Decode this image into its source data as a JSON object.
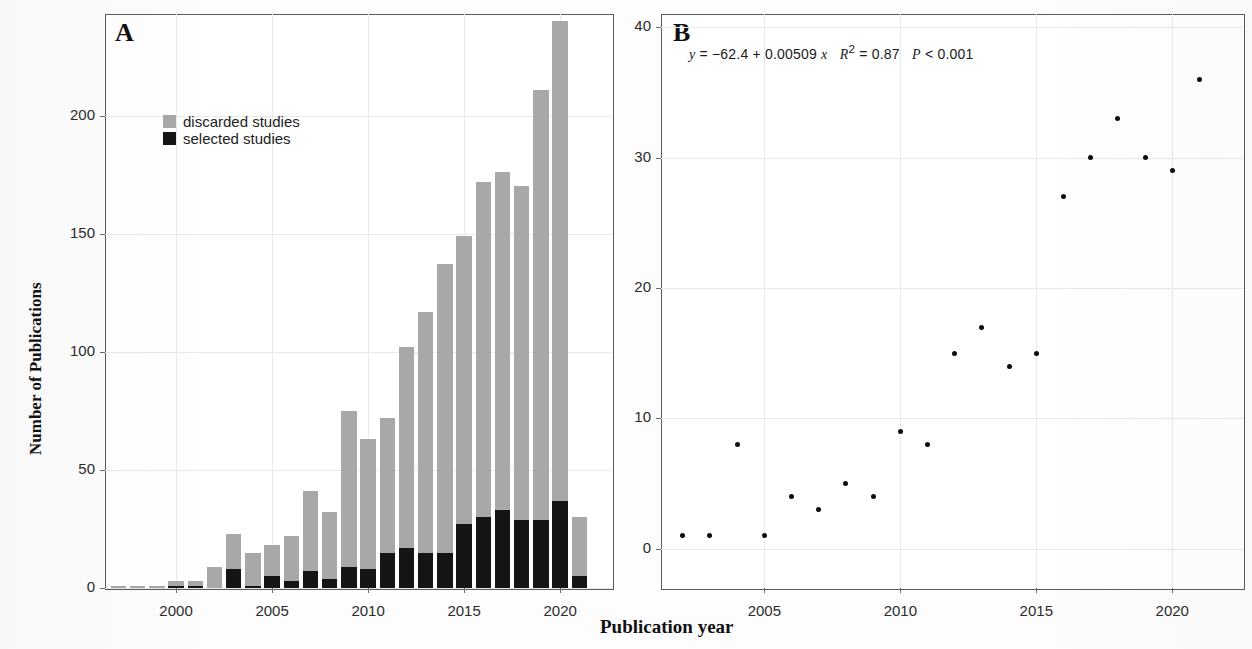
{
  "figure": {
    "shared_xlabel": "Publication year"
  },
  "panelA": {
    "letter": "A",
    "ylabel": "Number of Publications",
    "ylim": [
      0,
      243
    ],
    "xlim": [
      1996.3,
      2022.7
    ],
    "yticks": [
      "0",
      "50",
      "100",
      "150",
      "200"
    ],
    "ytick_values": [
      0,
      50,
      100,
      150,
      200
    ],
    "xticks": [
      "2000",
      "2005",
      "2010",
      "2015",
      "2020"
    ],
    "xtick_values": [
      2000,
      2005,
      2010,
      2015,
      2020
    ],
    "legend": [
      {
        "label": "discarded studies",
        "color": "#a8a8a8"
      },
      {
        "label": "selected studies",
        "color": "#151515"
      }
    ],
    "chart_data": {
      "type": "bar",
      "title": "",
      "xlabel": "Publication year",
      "ylabel": "Number of Publications",
      "ylim": [
        0,
        243
      ],
      "grid": true,
      "stacked": true,
      "legend_position": "upper-left",
      "categories": [
        1997,
        1998,
        1999,
        2000,
        2001,
        2002,
        2003,
        2004,
        2005,
        2006,
        2007,
        2008,
        2009,
        2010,
        2011,
        2012,
        2013,
        2014,
        2015,
        2016,
        2017,
        2018,
        2019,
        2020,
        2021,
        2022
      ],
      "series": [
        {
          "name": "selected studies",
          "color": "#151515",
          "values": [
            0,
            0,
            0,
            1,
            1,
            0,
            8,
            1,
            5,
            3,
            7,
            4,
            9,
            8,
            15,
            17,
            15,
            15,
            27,
            30,
            33,
            29,
            29,
            37,
            5,
            0
          ]
        },
        {
          "name": "discarded studies",
          "color": "#a8a8a8",
          "values": [
            1,
            1,
            1,
            2,
            2,
            9,
            15,
            14,
            13,
            19,
            34,
            28,
            66,
            55,
            87,
            85,
            102,
            122,
            122,
            147,
            143,
            141,
            182,
            203,
            25,
            0
          ]
        }
      ],
      "totals": [
        1,
        1,
        1,
        3,
        3,
        9,
        23,
        15,
        18,
        22,
        41,
        32,
        75,
        63,
        72,
        102,
        117,
        137,
        149,
        172,
        176,
        170,
        211,
        240,
        30,
        0
      ],
      "note": "Stacked totals per year; black = selected studies, gray = discarded studies"
    }
  },
  "panelB": {
    "letter": "B",
    "equation": "y = −62.4 + 0.00509 x   R² = 0.87   P < 0.001",
    "equation_parts": {
      "lhs": "y",
      "eq": "= −62.4 + 0.00509",
      "xvar": "x",
      "r2": "R",
      "r2sup": "2",
      "r2val": "= 0.87",
      "p": "P",
      "pval": "< 0.001"
    },
    "ylim": [
      -3,
      41
    ],
    "xlim": [
      2001.2,
      2022.6
    ],
    "yticks": [
      "0",
      "10",
      "20",
      "30",
      "40"
    ],
    "ytick_values": [
      0,
      10,
      20,
      30,
      40
    ],
    "xticks": [
      "2005",
      "2010",
      "2015",
      "2020"
    ],
    "xtick_values": [
      2005,
      2010,
      2015,
      2020
    ],
    "chart_data": {
      "type": "scatter",
      "title": "",
      "xlabel": "Publication year",
      "ylabel": "",
      "xlim": [
        2001.2,
        2022.6
      ],
      "ylim": [
        -3,
        41
      ],
      "grid": true,
      "annotation": "y = −62.4 + 0.00509 x   R² = 0.87   P < 0.001",
      "r_squared": 0.87,
      "p_value": "<0.001",
      "fit": {
        "intercept": -62.4,
        "slope": 0.00509,
        "type": "linear",
        "line_color": "#4a4a4a",
        "band_color": "#cccccc",
        "band": "95% confidence interval"
      },
      "points": [
        {
          "x": 2002,
          "y": 1
        },
        {
          "x": 2003,
          "y": 1
        },
        {
          "x": 2004,
          "y": 8
        },
        {
          "x": 2005,
          "y": 1
        },
        {
          "x": 2006,
          "y": 4
        },
        {
          "x": 2007,
          "y": 3
        },
        {
          "x": 2008,
          "y": 5
        },
        {
          "x": 2009,
          "y": 4
        },
        {
          "x": 2010,
          "y": 9
        },
        {
          "x": 2011,
          "y": 8
        },
        {
          "x": 2012,
          "y": 15
        },
        {
          "x": 2013,
          "y": 17
        },
        {
          "x": 2014,
          "y": 14
        },
        {
          "x": 2015,
          "y": 15
        },
        {
          "x": 2016,
          "y": 27
        },
        {
          "x": 2017,
          "y": 30
        },
        {
          "x": 2018,
          "y": 33
        },
        {
          "x": 2019,
          "y": 30
        },
        {
          "x": 2020,
          "y": 29
        },
        {
          "x": 2021,
          "y": 36
        }
      ]
    }
  }
}
